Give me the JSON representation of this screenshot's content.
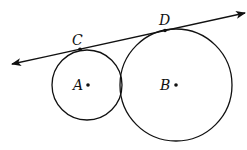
{
  "diagram": {
    "type": "geometry",
    "stroke_color": "#111111",
    "background": "#ffffff",
    "tangent_line": {
      "start": [
        12,
        64
      ],
      "end": [
        245,
        13
      ],
      "arrows": "both"
    },
    "circles": [
      {
        "id": "A",
        "label": "A",
        "center": [
          87,
          85
        ],
        "radius": 35
      },
      {
        "id": "B",
        "label": "B",
        "center": [
          176,
          85
        ],
        "radius": 56
      }
    ],
    "points": [
      {
        "id": "C",
        "label": "C",
        "position": [
          80,
          49
        ],
        "label_position": [
          72,
          45
        ]
      },
      {
        "id": "D",
        "label": "D",
        "position": [
          165,
          30
        ],
        "label_position": [
          159,
          25
        ]
      }
    ],
    "center_labels": [
      {
        "id": "A",
        "label": "A",
        "dot": [
          88,
          85
        ],
        "label_position": [
          73,
          90
        ]
      },
      {
        "id": "B",
        "label": "B",
        "dot": [
          176,
          85
        ],
        "label_position": [
          160,
          90
        ]
      }
    ]
  }
}
